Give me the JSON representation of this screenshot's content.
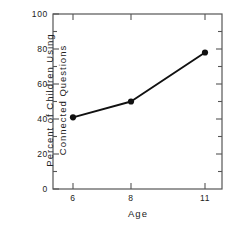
{
  "chart_data": {
    "type": "line",
    "title": "",
    "subtitle": "",
    "xlabel": "Age",
    "ylabel": "Percent of Children Using Connected Questions",
    "ylabel_lines": [
      "Percent of  Children  Using",
      "Connected  Questions"
    ],
    "x": [
      6,
      8,
      11
    ],
    "values": [
      41,
      50,
      78
    ],
    "series": [
      {
        "name": "Percent of Children Using Connected Questions",
        "values": [
          41,
          50,
          78
        ]
      }
    ],
    "xtick_labels": [
      "6",
      "8",
      "11"
    ],
    "xtick_values": [
      6,
      8,
      11
    ],
    "ytick_labels": [
      "0",
      "20",
      "40",
      "60",
      "80",
      "100"
    ],
    "ytick_values": [
      0,
      20,
      40,
      60,
      80,
      100
    ],
    "yminor_values": [
      10,
      30,
      50,
      70,
      90
    ],
    "xlim": [
      5,
      12
    ],
    "ylim": [
      0,
      100
    ],
    "grid": false,
    "legend": false,
    "legend_position": "none",
    "marker": "filled-circle",
    "line_color": "#111111",
    "marker_color": "#111111",
    "axis_color": "#444444",
    "background_color": "#ffffff",
    "annotations": []
  }
}
